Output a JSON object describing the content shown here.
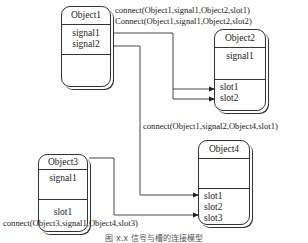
{
  "objects": {
    "object1": {
      "name": "Object1",
      "signals": [
        "signal1",
        "signal2"
      ],
      "slots": []
    },
    "object2": {
      "name": "Object2",
      "signals": [
        "signal1"
      ],
      "slots": [
        "slot1",
        "slot2"
      ]
    },
    "object3": {
      "name": "Object3",
      "signals": [
        "signal1"
      ],
      "slots": [
        "slot1"
      ]
    },
    "object4": {
      "name": "Object4",
      "signals": [],
      "slots": [
        "slot1",
        "slot2",
        "slot3"
      ]
    }
  },
  "connections": [
    {
      "label": "connect(Object1,signal1,Object2,slot1)"
    },
    {
      "label": "Connect(Object1,signal1,Object2,slot2)"
    },
    {
      "label": "connect(Object1,signal2,Object4,slot1)"
    },
    {
      "label": "connect(Object3,signal1,Object4,slot3)"
    }
  ],
  "caption": "图 x.x  信号与槽的连接模型"
}
